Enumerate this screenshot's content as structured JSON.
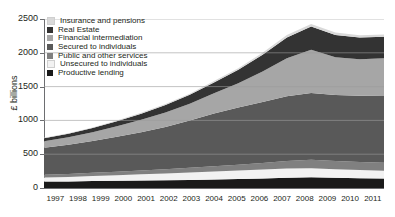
{
  "chart_data": {
    "type": "area",
    "stacked": true,
    "title": "",
    "xlabel": "",
    "ylabel": "£ billions",
    "ylim": [
      0,
      2500
    ],
    "yticks": [
      0,
      500,
      1000,
      1500,
      2000,
      2500
    ],
    "grid": true,
    "grid_axis": "y",
    "legend_position": "upper-left",
    "categories": [
      "1997",
      "1998",
      "1999",
      "2000",
      "2001",
      "2002",
      "2003",
      "2004",
      "2005",
      "2006",
      "2007",
      "2008",
      "2009",
      "2010",
      "2011"
    ],
    "series": [
      {
        "name": "Productive lending",
        "color": "#1a1a1a",
        "values": [
          95,
          98,
          102,
          108,
          112,
          116,
          120,
          126,
          132,
          140,
          150,
          158,
          150,
          145,
          142
        ]
      },
      {
        "name": "Unsecured to individuals",
        "color": "#f2f2f2",
        "values": [
          60,
          66,
          74,
          82,
          90,
          98,
          108,
          118,
          126,
          132,
          138,
          136,
          128,
          120,
          115
        ]
      },
      {
        "name": "Public and other services",
        "color": "#808080",
        "values": [
          40,
          44,
          48,
          52,
          58,
          64,
          70,
          78,
          86,
          96,
          110,
          125,
          122,
          120,
          118
        ]
      },
      {
        "name": "Secured to individuals",
        "color": "#595959",
        "values": [
          400,
          432,
          470,
          515,
          565,
          625,
          700,
          780,
          845,
          905,
          960,
          985,
          975,
          978,
          985
        ]
      },
      {
        "name": "Financial intermediation",
        "color": "#a6a6a6",
        "values": [
          95,
          110,
          130,
          155,
          185,
          215,
          250,
          300,
          360,
          450,
          560,
          640,
          560,
          540,
          560
        ]
      },
      {
        "name": "Real Estate",
        "color": "#333333",
        "values": [
          45,
          52,
          62,
          74,
          90,
          108,
          130,
          160,
          200,
          250,
          310,
          345,
          330,
          322,
          318
        ]
      },
      {
        "name": "Insurance and pensions",
        "color": "#d9d9d9",
        "values": [
          8,
          9,
          10,
          12,
          14,
          16,
          18,
          21,
          24,
          28,
          34,
          38,
          36,
          35,
          34
        ]
      }
    ],
    "legend_order": [
      "Insurance and pensions",
      "Real Estate",
      "Financial intermediation",
      "Secured to individuals",
      "Public and other services",
      "Unsecured to individuals",
      "Productive lending"
    ]
  },
  "legend": {
    "items": [
      {
        "label": "Insurance and pensions",
        "color": "#d9d9d9"
      },
      {
        "label": "Real Estate",
        "color": "#333333"
      },
      {
        "label": "Financial intermediation",
        "color": "#a6a6a6"
      },
      {
        "label": "Secured to individuals",
        "color": "#595959"
      },
      {
        "label": "Public and other services",
        "color": "#808080"
      },
      {
        "label": "Unsecured to individuals",
        "color": "#f2f2f2"
      },
      {
        "label": "Productive lending",
        "color": "#1a1a1a"
      }
    ]
  },
  "axis": {
    "y_title": "£ billions",
    "y_ticks": [
      "2500",
      "2000",
      "1500",
      "1000",
      "500",
      "0"
    ],
    "x_ticks": [
      "1997",
      "1998",
      "1999",
      "2000",
      "2001",
      "2002",
      "2003",
      "2004",
      "2005",
      "2006",
      "2007",
      "2008",
      "2009",
      "2010",
      "2011"
    ]
  }
}
